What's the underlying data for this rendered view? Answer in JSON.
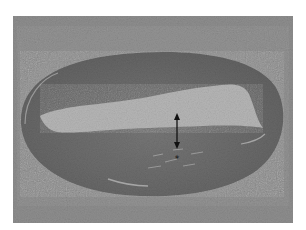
{
  "figure": {
    "type": "histology micrograph",
    "annotations": {
      "arrow": "double-headed arrow indicating wall thickness",
      "marker": "*"
    },
    "colors": {
      "background": "#ffffff",
      "adventitia": "#8f8f8f",
      "wall": "#6e6e6e",
      "lumen": "#b4b4b4",
      "arrow": "#111111"
    }
  }
}
